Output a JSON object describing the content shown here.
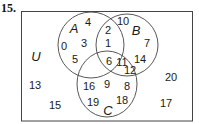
{
  "problem_number": "15.",
  "universe_label": "U",
  "sets": [
    {
      "name": "A",
      "label": "A"
    },
    {
      "name": "B",
      "label": "B"
    },
    {
      "name": "C",
      "label": "C"
    }
  ],
  "regions": {
    "A_only": [
      "4",
      "0",
      "3",
      "5"
    ],
    "B_only": [
      "10",
      "7",
      "14"
    ],
    "C_only": [
      "16",
      "9",
      "8",
      "19",
      "18"
    ],
    "A_and_B_only": [
      "2",
      "1"
    ],
    "A_and_B_and_C": [
      "6"
    ],
    "B_and_C_only": [
      "11",
      "12"
    ],
    "A_and_C_only": [],
    "outside": [
      "13",
      "15",
      "20",
      "17"
    ]
  },
  "colors": {
    "line": "#333333",
    "text": "#1a1a1a",
    "background": "#ffffff"
  }
}
